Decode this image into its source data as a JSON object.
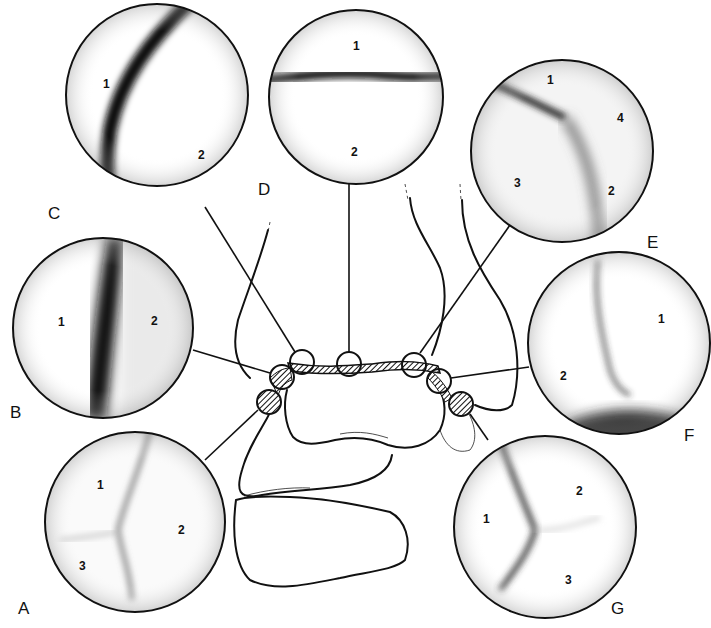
{
  "figure": {
    "panels": [
      {
        "letter": "A",
        "regions": [
          "1",
          "2",
          "3"
        ]
      },
      {
        "letter": "B",
        "regions": [
          "1",
          "2"
        ]
      },
      {
        "letter": "C",
        "regions": [
          "1",
          "2"
        ]
      },
      {
        "letter": "D",
        "regions": [
          "1",
          "2"
        ]
      },
      {
        "letter": "E",
        "regions": [
          "1",
          "2",
          "3",
          "4"
        ]
      },
      {
        "letter": "F",
        "regions": [
          "1",
          "2"
        ]
      },
      {
        "letter": "G",
        "regions": [
          "1",
          "2",
          "3"
        ]
      }
    ],
    "colors": {
      "ink": "#111111",
      "background": "#ffffff",
      "shadow": "#2a2a2a"
    }
  }
}
